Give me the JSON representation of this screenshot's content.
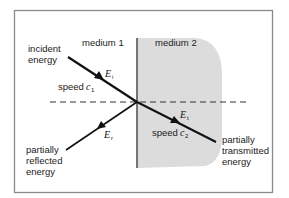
{
  "diagram": {
    "title": "",
    "media": [
      {
        "label": "medium 1",
        "speed_label": "speed",
        "speed_symbol": "c",
        "speed_sub": "1"
      },
      {
        "label": "medium 2",
        "speed_label": "speed",
        "speed_symbol": "c",
        "speed_sub": "2"
      }
    ],
    "rays": {
      "incident": {
        "label_line1": "incident",
        "label_line2": "energy",
        "symbol": "E",
        "sub": "i"
      },
      "reflected": {
        "label_line1": "partially",
        "label_line2": "reflected",
        "label_line3": "energy",
        "symbol": "E",
        "sub": "r"
      },
      "transmitted": {
        "label_line1": "partially",
        "label_line2": "transmitted",
        "label_line3": "energy",
        "symbol": "E",
        "sub": "t"
      }
    },
    "normal_line": "dashed",
    "colors": {
      "background": "#ffffff",
      "frame": "#8a8a8a",
      "medium2_fill": "#dcdcdc",
      "rays": "#111111",
      "boundary": "#555555"
    }
  }
}
